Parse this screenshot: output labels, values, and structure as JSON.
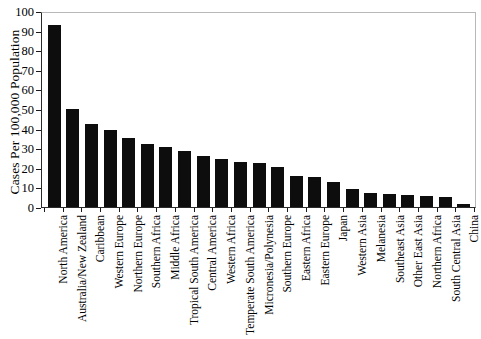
{
  "chart_data": {
    "type": "bar",
    "title": "",
    "xlabel": "",
    "ylabel": "Cases Per 100,000 Population",
    "ylim": [
      0,
      100
    ],
    "ytick_values": [
      0,
      10,
      20,
      30,
      40,
      50,
      60,
      70,
      80,
      90,
      100
    ],
    "ytick_labels": [
      "0",
      "10",
      "20",
      "30",
      "40",
      "50",
      "60",
      "70",
      "80",
      "90",
      "100"
    ],
    "grid": false,
    "legend": null,
    "bar_color": "#0d0d0d",
    "categories": [
      "North America",
      "Australia/New Zealand",
      "Caribbean",
      "Western Europe",
      "Northern Europe",
      "Southern Africa",
      "Middle Africa",
      "Tropical South America",
      "Central America",
      "Western Africa",
      "Temperate South America",
      "Micronesia/Polynesia",
      "Southern Europe",
      "Eastern Africa",
      "Eastern Europe",
      "Japan",
      "Western Asia",
      "Melanesia",
      "Southeast Asia",
      "Other East Asia",
      "Northern Africa",
      "South Central Asia",
      "China"
    ],
    "values": [
      93,
      50,
      42.5,
      39.5,
      35,
      32,
      30.5,
      28.5,
      26,
      24.5,
      23,
      22.5,
      20.5,
      16,
      15.5,
      13,
      9,
      7,
      6.5,
      6,
      5.5,
      5,
      1.5
    ]
  }
}
